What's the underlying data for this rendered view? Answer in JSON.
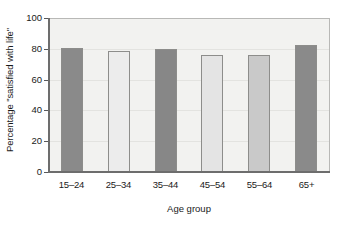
{
  "chart_data": {
    "type": "bar",
    "title": "",
    "xlabel": "Age group",
    "ylabel": "Percentage \"satisfied with life\"",
    "categories": [
      "15–24",
      "25–34",
      "35–44",
      "45–54",
      "55–64",
      "65+"
    ],
    "values": [
      81,
      79,
      80,
      76,
      76,
      83
    ],
    "bar_colors": [
      "#8a8a8a",
      "#ececec",
      "#878787",
      "#e4e4e4",
      "#c9c9c9",
      "#8a8a8a"
    ],
    "ylim": [
      0,
      100
    ],
    "yticks": [
      0,
      20,
      40,
      60,
      80,
      100
    ],
    "ytick_labels": [
      "0",
      "20",
      "40",
      "60",
      "80",
      "100"
    ],
    "grid": true,
    "grid_axis": "y",
    "legend": null,
    "plot_background": "#f2f2f0",
    "axis_color": "#6d6d6d",
    "text_color": "#1a1a1a"
  }
}
